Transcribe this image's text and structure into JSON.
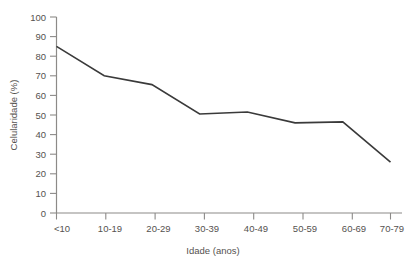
{
  "chart_data": {
    "type": "line",
    "title": "",
    "xlabel": "Idade (anos)",
    "ylabel": "Celularidade (%)",
    "categories": [
      "<10",
      "10-19",
      "20-29",
      "30-39",
      "40-49",
      "50-59",
      "60-69",
      "70-79"
    ],
    "values": [
      85,
      70,
      65.5,
      50.5,
      51.5,
      46,
      46.5,
      26
    ],
    "series": [
      {
        "name": "Celularidade",
        "values": [
          85,
          70,
          65.5,
          50.5,
          51.5,
          46,
          46.5,
          26
        ]
      }
    ],
    "ylim": [
      0,
      100
    ],
    "ytick_labels": [
      "0",
      "10",
      "20",
      "30",
      "40",
      "50",
      "60",
      "70",
      "80",
      "90",
      "100"
    ],
    "ytick_values": [
      0,
      10,
      20,
      30,
      40,
      50,
      60,
      70,
      80,
      90,
      100
    ],
    "xtick_labels": [
      "<10",
      "10-19",
      "20-29",
      "30-39",
      "40-49",
      "50-59",
      "60-69",
      "70-79"
    ],
    "grid": false,
    "legend": false,
    "legend_position": "none",
    "colors": {
      "line": "#3a3a3a",
      "axis": "#8c8a88",
      "text": "#55524f",
      "background": "#ffffff"
    }
  }
}
